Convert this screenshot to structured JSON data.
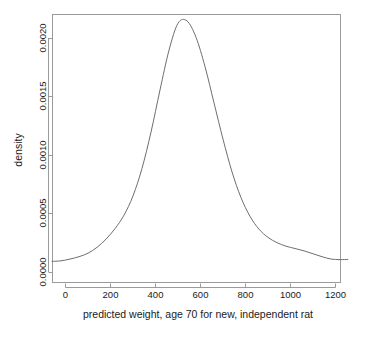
{
  "figure": {
    "background_color": "#ffffff",
    "line_color": "#6e6e6e",
    "axis_color": "#9a9a9a",
    "text_color": "#1a1a1a"
  },
  "axes": {
    "xlabel": "predicted weight, age 70 for new, independent rat",
    "ylabel": "density",
    "x_ticks": [
      "0",
      "200",
      "400",
      "600",
      "800",
      "1000",
      "1200"
    ],
    "y_ticks": [
      "0.0000",
      "0.0005",
      "0.0010",
      "0.0015",
      "0.0020"
    ]
  },
  "caption": {
    "text": ""
  },
  "chart_data": {
    "type": "line",
    "title": "",
    "subtitle": "",
    "xlabel": "predicted weight, age 70 for new, independent rat",
    "ylabel": "density",
    "xlim": [
      -60,
      1255
    ],
    "ylim": [
      -3e-05,
      0.00225
    ],
    "xticks": [
      0,
      200,
      400,
      600,
      800,
      1000,
      1200
    ],
    "yticks": [
      0.0,
      0.0005,
      0.001,
      0.0015,
      0.002
    ],
    "grid": false,
    "legend": null,
    "series": [
      {
        "name": "density",
        "x": [
          -60,
          -20,
          20,
          60,
          100,
          140,
          180,
          220,
          260,
          300,
          340,
          380,
          420,
          460,
          500,
          540,
          580,
          620,
          660,
          700,
          740,
          780,
          820,
          860,
          900,
          940,
          980,
          1020,
          1060,
          1100,
          1140,
          1180,
          1220,
          1255
        ],
        "y": [
          9.5e-05,
          0.0001,
          0.000115,
          0.000135,
          0.000165,
          0.000215,
          0.000285,
          0.000375,
          0.00049,
          0.000655,
          0.00089,
          0.0012,
          0.00156,
          0.0019,
          0.00213,
          0.00215,
          0.00201,
          0.00176,
          0.00145,
          0.00114,
          0.00086,
          0.00064,
          0.00048,
          0.00037,
          0.0003,
          0.000255,
          0.000225,
          0.000205,
          0.000185,
          0.00016,
          0.000135,
          0.000115,
          0.00011,
          0.000112
        ]
      }
    ]
  }
}
